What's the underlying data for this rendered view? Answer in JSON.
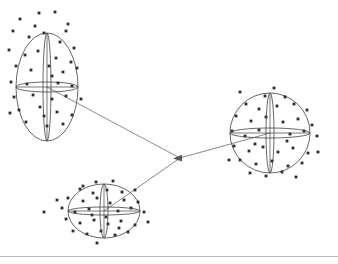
{
  "figure": {
    "title": "",
    "caption": "",
    "background_color": "#ffffff",
    "width": 338,
    "height": 264,
    "style": {
      "outline_color": "#55565a",
      "axis_color": "#3f4044",
      "connector_color": "#6a6b70",
      "datapoint_color": "#2b2c30",
      "rule_color": "#9a9b9f"
    }
  },
  "junction": {
    "label": "junction-node",
    "x": 180,
    "y": 158,
    "arrow_direction": "left"
  },
  "baseline_rule": {
    "label": "bottom-rule",
    "x1": 0,
    "y1": 256.5,
    "x2": 338,
    "y2": 256.5
  },
  "connectors": [
    {
      "name": "connector-top-left-to-junction",
      "from": "cluster-top-left",
      "to": "junction",
      "x1": 47,
      "y1": 87,
      "x2": 180,
      "y2": 158
    },
    {
      "name": "connector-bottom-to-junction",
      "from": "cluster-bottom",
      "to": "junction",
      "x1": 104,
      "y1": 211,
      "x2": 180,
      "y2": 158
    },
    {
      "name": "connector-junction-to-right",
      "from": "junction",
      "to": "cluster-right",
      "x1": 180,
      "y1": 158,
      "x2": 270,
      "y2": 133
    }
  ],
  "clusters": [
    {
      "name": "cluster-top-left",
      "shape": "ellipse",
      "cx": 47,
      "cy": 87,
      "rx": 31,
      "ry": 54,
      "vertical_lens_half_width": 4,
      "horizontal_lens_half_height": 5,
      "points": [
        [
          20,
          19
        ],
        [
          39,
          13
        ],
        [
          55,
          12
        ],
        [
          68,
          24
        ],
        [
          13,
          31
        ],
        [
          29,
          37
        ],
        [
          44,
          33
        ],
        [
          60,
          42
        ],
        [
          74,
          48
        ],
        [
          9,
          50
        ],
        [
          25,
          55
        ],
        [
          38,
          51
        ],
        [
          56,
          58
        ],
        [
          71,
          62
        ],
        [
          16,
          66
        ],
        [
          31,
          70
        ],
        [
          49,
          66
        ],
        [
          63,
          72
        ],
        [
          77,
          68
        ],
        [
          11,
          82
        ],
        [
          27,
          84
        ],
        [
          58,
          83
        ],
        [
          72,
          86
        ],
        [
          14,
          97
        ],
        [
          33,
          95
        ],
        [
          52,
          99
        ],
        [
          66,
          96
        ],
        [
          19,
          110
        ],
        [
          40,
          107
        ],
        [
          57,
          112
        ],
        [
          72,
          115
        ],
        [
          26,
          122
        ],
        [
          47,
          126
        ],
        [
          63,
          124
        ],
        [
          10,
          113
        ],
        [
          81,
          99
        ],
        [
          35,
          26
        ],
        [
          52,
          76
        ],
        [
          44,
          116
        ],
        [
          66,
          31
        ]
      ]
    },
    {
      "name": "cluster-right",
      "shape": "circle",
      "cx": 270,
      "cy": 133,
      "rx": 40,
      "ry": 40,
      "vertical_lens_half_width": 4,
      "horizontal_lens_half_height": 5,
      "points": [
        [
          265,
          96
        ],
        [
          285,
          97
        ],
        [
          246,
          104
        ],
        [
          259,
          109
        ],
        [
          277,
          106
        ],
        [
          294,
          104
        ],
        [
          307,
          110
        ],
        [
          236,
          116
        ],
        [
          251,
          121
        ],
        [
          266,
          117
        ],
        [
          283,
          122
        ],
        [
          298,
          119
        ],
        [
          312,
          125
        ],
        [
          232,
          131
        ],
        [
          245,
          136
        ],
        [
          259,
          130
        ],
        [
          290,
          134
        ],
        [
          304,
          131
        ],
        [
          317,
          136
        ],
        [
          234,
          146
        ],
        [
          249,
          151
        ],
        [
          263,
          147
        ],
        [
          278,
          152
        ],
        [
          293,
          148
        ],
        [
          308,
          153
        ],
        [
          240,
          160
        ],
        [
          256,
          164
        ],
        [
          272,
          161
        ],
        [
          288,
          166
        ],
        [
          302,
          163
        ],
        [
          250,
          173
        ],
        [
          266,
          176
        ],
        [
          282,
          172
        ],
        [
          296,
          177
        ],
        [
          318,
          152
        ],
        [
          229,
          160
        ],
        [
          274,
          88
        ],
        [
          240,
          92
        ],
        [
          255,
          144
        ],
        [
          287,
          141
        ]
      ]
    },
    {
      "name": "cluster-bottom",
      "shape": "ellipse",
      "cx": 104,
      "cy": 211,
      "rx": 36,
      "ry": 27,
      "vertical_lens_half_width": 4,
      "horizontal_lens_half_height": 4,
      "points": [
        [
          96,
          182
        ],
        [
          113,
          181
        ],
        [
          80,
          189
        ],
        [
          93,
          193
        ],
        [
          107,
          190
        ],
        [
          122,
          192
        ],
        [
          135,
          190
        ],
        [
          68,
          198
        ],
        [
          83,
          201
        ],
        [
          97,
          198
        ],
        [
          110,
          203
        ],
        [
          124,
          200
        ],
        [
          138,
          202
        ],
        [
          62,
          208
        ],
        [
          75,
          212
        ],
        [
          89,
          209
        ],
        [
          118,
          211
        ],
        [
          131,
          208
        ],
        [
          144,
          212
        ],
        [
          66,
          219
        ],
        [
          80,
          223
        ],
        [
          94,
          220
        ],
        [
          108,
          224
        ],
        [
          121,
          221
        ],
        [
          135,
          225
        ],
        [
          73,
          231
        ],
        [
          87,
          234
        ],
        [
          101,
          231
        ],
        [
          115,
          235
        ],
        [
          128,
          232
        ],
        [
          97,
          243
        ],
        [
          44,
          212
        ],
        [
          57,
          200
        ],
        [
          148,
          222
        ],
        [
          92,
          215
        ],
        [
          106,
          217
        ],
        [
          119,
          228
        ],
        [
          83,
          186
        ]
      ]
    }
  ]
}
